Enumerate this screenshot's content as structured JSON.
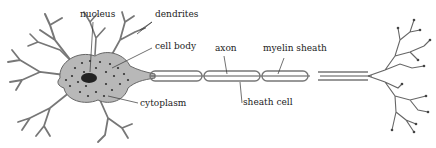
{
  "diagram": {
    "labels": {
      "nucleus": "nucleus",
      "dendrites": "dendrites",
      "cell_body": "cell body",
      "axon": "axon",
      "myelin_sheath": "myelin sheath",
      "cytoplasm": "cytoplasm",
      "sheath_cell": "sheath cell"
    },
    "colors": {
      "cell_fill": "#b8b8b8",
      "cell_stroke": "#666666",
      "dots": "#333333",
      "nucleus": "#222222",
      "axon_line": "#555555",
      "text": "#222222"
    }
  }
}
